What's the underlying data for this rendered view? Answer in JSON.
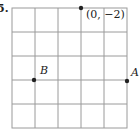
{
  "problem_number": "5.",
  "grid": {
    "columns": 5,
    "rows": 5,
    "line_color": "#9a9a9a"
  },
  "points": [
    {
      "id": "top",
      "label": "(0, −2)",
      "x": 81,
      "y": 8
    },
    {
      "id": "B",
      "label": "B",
      "x": 34,
      "y": 80
    },
    {
      "id": "A",
      "label": "A",
      "x": 127,
      "y": 81
    }
  ]
}
